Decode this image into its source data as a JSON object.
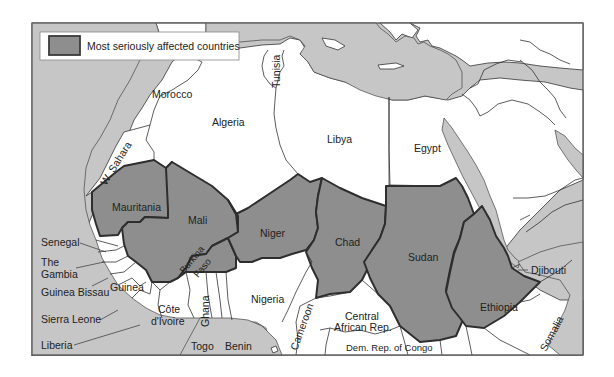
{
  "map": {
    "legend": {
      "label": "Most seriously affected countries",
      "swatch_color": "#8e8e8e"
    },
    "colors": {
      "sea": "#c6c6c6",
      "land": "#ffffff",
      "affected": "#8e8e8e",
      "affected_border": "#2e2e2e"
    },
    "affected_countries": [
      "Mauritania",
      "Mali",
      "Burkina Faso",
      "Niger",
      "Chad",
      "Sudan",
      "Ethiopia"
    ],
    "labels": {
      "morocco": "Morocco",
      "algeria": "Algeria",
      "tunisia": "Tunisia",
      "libya": "Libya",
      "egypt": "Egypt",
      "w_sahara": "W. Sahara",
      "mauritania": "Mauritania",
      "mali": "Mali",
      "niger": "Niger",
      "chad": "Chad",
      "sudan": "Sudan",
      "ethiopia": "Ethiopia",
      "burkina_1": "Burkina",
      "burkina_2": "Faso",
      "senegal": "Senegal",
      "gambia_1": "The",
      "gambia_2": "Gambia",
      "guinea_bissau": "Guinea Bissau",
      "guinea": "Guinea",
      "sierra_leone": "Sierra Leone",
      "liberia": "Liberia",
      "cote_1": "Côte",
      "cote_2": "d'Ivoire",
      "ghana": "Ghana",
      "togo": "Togo",
      "benin": "Benin",
      "nigeria": "Nigeria",
      "cameroon": "Cameroon",
      "car_1": "Central",
      "car_2": "African Rep.",
      "drc": "Dem. Rep. of Congo",
      "djibouti": "Djibouti",
      "somalia": "Somalia"
    }
  }
}
